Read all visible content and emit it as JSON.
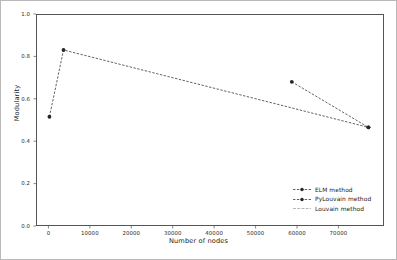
{
  "chart_data": {
    "type": "line",
    "title": "",
    "xlabel": "Number of nodes",
    "ylabel": "Modularity",
    "xlim": [
      -3000,
      81000
    ],
    "ylim": [
      0.0,
      1.0
    ],
    "xticks": [
      0,
      10000,
      20000,
      30000,
      40000,
      50000,
      60000,
      70000
    ],
    "xticklabels": [
      "0",
      "10000",
      "20000",
      "30000",
      "40000",
      "50000",
      "60000",
      "70000"
    ],
    "yticks": [
      0.0,
      0.2,
      0.4,
      0.6,
      0.8,
      1.0
    ],
    "yticklabels": [
      "0.0",
      "0.2",
      "0.4",
      "0.6",
      "0.8",
      "1.0"
    ],
    "grid": false,
    "legend_position": "lower right",
    "series": [
      {
        "name": "ELM method",
        "style": "dashed-marker",
        "color": "#3a3a3a",
        "points": [
          {
            "x": 0,
            "y": 0.52
          },
          {
            "x": 3400,
            "y": 0.835
          },
          {
            "x": 77000,
            "y": 0.47
          }
        ]
      },
      {
        "name": "PyLouvain method",
        "style": "dashed-marker",
        "color": "#3a3a3a",
        "points": [
          {
            "x": 58500,
            "y": 0.685
          },
          {
            "x": 77000,
            "y": 0.47
          }
        ]
      },
      {
        "name": "Louvain method",
        "style": "solid-thin",
        "color": "#9a9a9a",
        "points": []
      }
    ]
  },
  "legend": {
    "items": [
      {
        "label": "ELM method"
      },
      {
        "label": "PyLouvain method"
      },
      {
        "label": "Louvain method"
      }
    ]
  }
}
